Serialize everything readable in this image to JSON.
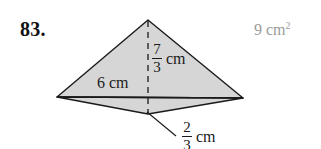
{
  "problem": {
    "number": "83."
  },
  "answer": {
    "value": "9",
    "unit": "cm",
    "exponent": "2",
    "color": "#9a9a9a"
  },
  "figure": {
    "name": "kite-shape",
    "fill_color": "#d6d6d6",
    "stroke_color": "#1a1a1a",
    "dashed_line_name": "height-dashed-line",
    "leader_line_name": "depth-leader-line",
    "vertices": {
      "top": [
        148,
        20
      ],
      "left": [
        57,
        97
      ],
      "right": [
        243,
        98
      ],
      "bottom": [
        148,
        114
      ]
    }
  },
  "labels": {
    "base": {
      "text": "6 cm"
    },
    "height": {
      "numerator": "7",
      "denominator": "3",
      "unit": "cm"
    },
    "depth": {
      "numerator": "2",
      "denominator": "3",
      "unit": "cm"
    }
  }
}
